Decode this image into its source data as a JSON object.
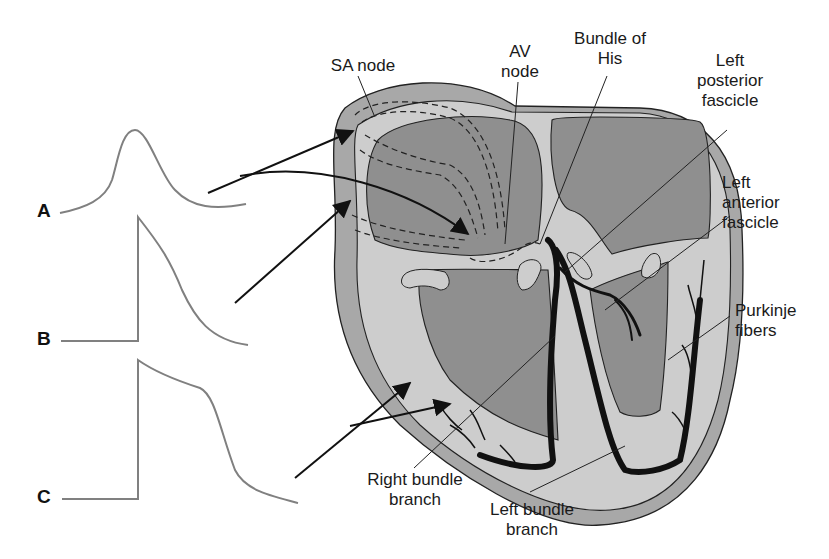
{
  "figure": {
    "traces": [
      {
        "id": "A",
        "label": "A",
        "shape": "slow-rise pacemaker action potential"
      },
      {
        "id": "B",
        "label": "B",
        "shape": "fast-upstroke action potential"
      },
      {
        "id": "C",
        "label": "C",
        "shape": "fast-upstroke action potential with plateau"
      }
    ],
    "labels": {
      "sa_node": "SA node",
      "av_node_1": "AV",
      "av_node_2": "node",
      "bundle_his_1": "Bundle of",
      "bundle_his_2": "His",
      "left_posterior_1": "Left",
      "left_posterior_2": "posterior",
      "left_posterior_3": "fascicle",
      "left_anterior_1": "Left",
      "left_anterior_2": "anterior",
      "left_anterior_3": "fascicle",
      "purkinje_1": "Purkinje",
      "purkinje_2": "fibers",
      "right_bundle_1": "Right bundle",
      "right_bundle_2": "branch",
      "left_bundle_1": "Left bundle",
      "left_bundle_2": "branch"
    },
    "colors": {
      "outer_wall": "#a9a9a9",
      "chamber": "#8e8e8e",
      "septum_light": "#cdcdcd",
      "conduction": "#111111",
      "trace": "#808080",
      "text": "#1a1a1a"
    }
  }
}
